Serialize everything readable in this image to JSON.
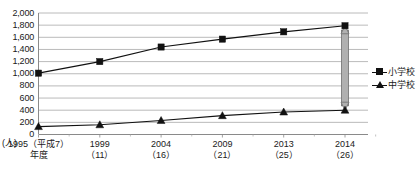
{
  "chart_data": {
    "type": "line",
    "title": "",
    "xlabel": "",
    "ylabel": "",
    "unit_label": "(人)",
    "ylim": [
      0,
      2000
    ],
    "ytick_step": 200,
    "grid": true,
    "legend_position": "right",
    "y_ticks": [
      "2,000",
      "1,800",
      "1,600",
      "1,400",
      "1,200",
      "1,000",
      "800",
      "600",
      "400",
      "200",
      "0"
    ],
    "y_tick_values": [
      2000,
      1800,
      1600,
      1400,
      1200,
      1000,
      800,
      600,
      400,
      200,
      0
    ],
    "categories": [
      {
        "line1": "1995（平成7）",
        "line2": "年度"
      },
      {
        "line1": "1999",
        "line2": "（11）"
      },
      {
        "line1": "2004",
        "line2": "（16）"
      },
      {
        "line1": "2009",
        "line2": "（21）"
      },
      {
        "line1": "2013",
        "line2": "（25）"
      },
      {
        "line1": "2014",
        "line2": "（26）"
      }
    ],
    "series": [
      {
        "name": "小学校",
        "marker": "square",
        "color": "#111111",
        "values": [
          1010,
          1200,
          1440,
          1570,
          1690,
          1790
        ]
      },
      {
        "name": "中学校",
        "marker": "triangle",
        "color": "#111111",
        "values": [
          130,
          160,
          230,
          310,
          370,
          400
        ]
      }
    ],
    "annotations": [
      {
        "name": "gap-arrow",
        "type": "double-headed-arrow",
        "color": "#9a9a9a",
        "at_category_index": 5,
        "from_value": 1790,
        "to_value": 400
      }
    ]
  },
  "legend": {
    "items": [
      {
        "label": "小学校",
        "marker": "square"
      },
      {
        "label": "中学校",
        "marker": "triangle"
      }
    ]
  }
}
